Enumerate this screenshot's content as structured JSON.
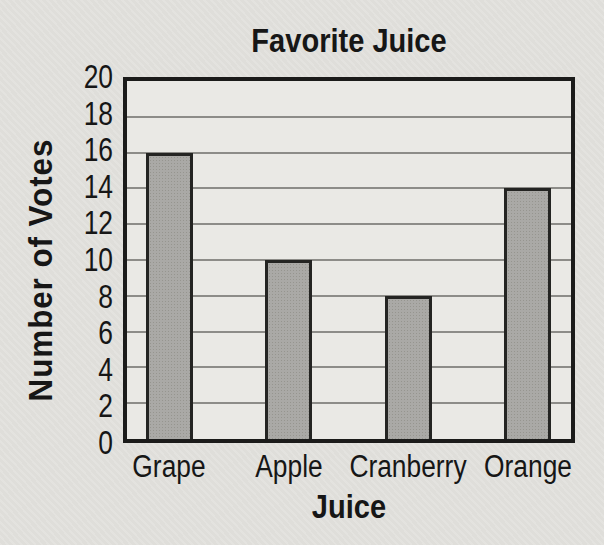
{
  "chart_data": {
    "type": "bar",
    "title": "Favorite Juice",
    "xlabel": "Juice",
    "ylabel": "Number of Votes",
    "categories": [
      "Grape",
      "Apple",
      "Cranberry",
      "Orange"
    ],
    "values": [
      16,
      10,
      8,
      14
    ],
    "ylim": [
      0,
      20
    ],
    "ytick_step": 2,
    "yticks": [
      0,
      2,
      4,
      6,
      8,
      10,
      12,
      14,
      16,
      18,
      20
    ],
    "grid": true,
    "legend": "none",
    "colors": {
      "paper_bg": "#dfdeda",
      "plot_bg": "#eae9e5",
      "bar_fill": "#aaa9a6",
      "bar_border": "#242422",
      "axis_border": "#1b1b1a",
      "gridline": "#8d8c88",
      "text": "#161616"
    }
  }
}
